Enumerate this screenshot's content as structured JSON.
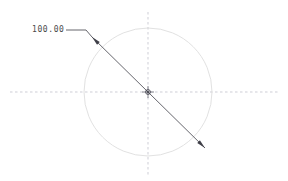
{
  "drawing": {
    "title": "Circle diameter dimension",
    "background_color": "#ffffff",
    "width": 288,
    "height": 181,
    "dimension": {
      "label": "100.00",
      "value": 100.0,
      "type": "diameter",
      "text_color": "#4a4a4a",
      "text_x": 32,
      "text_y": 26
    },
    "circle": {
      "center_x": 148,
      "center_y": 92,
      "radius": 64,
      "stroke_color": "#d9d9d9",
      "stroke_width": 0.8
    },
    "centerlines": {
      "stroke_color": "#b9b9c4",
      "stroke_width": 0.7,
      "dash": "2.5 2.5",
      "horizontal": {
        "x1": 10,
        "y1": 92,
        "x2": 278,
        "y2": 92
      },
      "vertical": {
        "x1": 148,
        "y1": 12,
        "x2": 148,
        "y2": 175
      }
    },
    "center_mark": {
      "x": 148,
      "y": 92,
      "color": "#555560",
      "size": 6
    },
    "dimension_line": {
      "stroke_color": "#3f3f48",
      "stroke_width": 0.8,
      "start_x": 92,
      "start_y": 37,
      "end_x": 205,
      "end_y": 148,
      "arrow_length": 9,
      "arrow_half_width": 1.9
    },
    "leader_line": {
      "stroke_color": "#3f3f48",
      "stroke_width": 0.8,
      "x1": 66,
      "y1": 30,
      "x2": 86,
      "y2": 30,
      "elbow_x": 92,
      "elbow_y": 37
    }
  }
}
